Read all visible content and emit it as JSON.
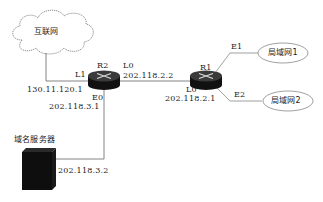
{
  "diagram": {
    "nodes": {
      "internet": {
        "label": "互联网",
        "shape": "cloud"
      },
      "r2": {
        "label": "R2",
        "shape": "router"
      },
      "r1": {
        "label": "R1",
        "shape": "router"
      },
      "lan1": {
        "label": "局域网1",
        "shape": "ellipse"
      },
      "lan2": {
        "label": "局域网2",
        "shape": "ellipse"
      },
      "dns": {
        "label": "域名服务器",
        "shape": "server"
      }
    },
    "interfaces": {
      "r2_l1": {
        "name": "L1",
        "ip": "130.11.120.1"
      },
      "r2_l0": {
        "name": "L0",
        "ip": "202.118.2.2"
      },
      "r2_e0": {
        "name": "E0",
        "ip": "202.118.3.1"
      },
      "r1_l0": {
        "name": "L0",
        "ip": "202.118.2.1"
      },
      "r1_e1": {
        "name": "E1"
      },
      "r1_e2": {
        "name": "E2"
      },
      "dns_ip": {
        "ip": "202.118.3.2"
      }
    },
    "links": [
      {
        "from": "internet",
        "to": "r2",
        "via": "L1"
      },
      {
        "from": "r2",
        "to": "r1",
        "via": "L0"
      },
      {
        "from": "r2",
        "to": "dns",
        "via": "E0"
      },
      {
        "from": "r1",
        "to": "lan1",
        "via": "E1"
      },
      {
        "from": "r1",
        "to": "lan2",
        "via": "E2"
      }
    ]
  }
}
